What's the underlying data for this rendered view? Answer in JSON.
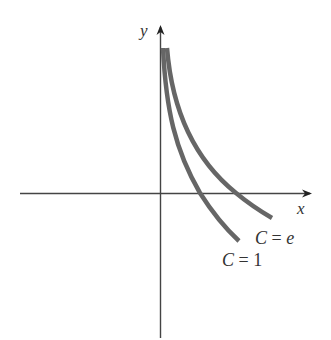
{
  "diagram": {
    "type": "coordinate-plot",
    "axes": {
      "x_label": "x",
      "y_label": "y"
    },
    "curves": [
      {
        "name": "curve-c-1",
        "label_var": "C",
        "label_eq": " = ",
        "label_val": "1",
        "label_val_italic": false
      },
      {
        "name": "curve-c-e",
        "label_var": "C",
        "label_eq": " = ",
        "label_val": "e",
        "label_val_italic": true
      }
    ],
    "colors": {
      "axis": "#444444",
      "curve": "#666666",
      "text": "#333333"
    }
  }
}
